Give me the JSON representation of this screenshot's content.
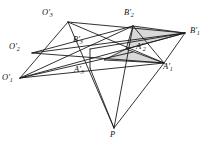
{
  "figure": {
    "name": "geometric-perspective-figure",
    "background_color": "#ffffff",
    "line_color": "#1b1b1b",
    "shade_color": "#c9c9c9",
    "width": 213,
    "height": 149
  },
  "vertices": [
    {
      "id": "O3",
      "base": "O",
      "prime": "′",
      "sub": "3",
      "label": "O′3",
      "x": 68,
      "y": 22,
      "label_x": 42,
      "label_y": 9
    },
    {
      "id": "B2",
      "base": "B",
      "prime": "′",
      "sub": "2",
      "label": "B′2",
      "x": 133,
      "y": 26,
      "label_x": 124,
      "label_y": 9
    },
    {
      "id": "B1",
      "base": "B",
      "prime": "′",
      "sub": "1",
      "label": "B′1",
      "x": 185,
      "y": 33,
      "label_x": 190,
      "label_y": 27
    },
    {
      "id": "B3",
      "base": "B",
      "prime": "′",
      "sub": "3",
      "label": "B′3",
      "x": 90,
      "y": 49,
      "label_x": 73,
      "label_y": 36
    },
    {
      "id": "A2",
      "base": "A",
      "prime": "′",
      "sub": "2",
      "label": "A′2",
      "x": 133,
      "y": 52,
      "label_x": 136,
      "label_y": 43
    },
    {
      "id": "O2",
      "base": "O",
      "prime": "′",
      "sub": "2",
      "label": "O′2",
      "x": 32,
      "y": 53,
      "label_x": 9,
      "label_y": 43
    },
    {
      "id": "A1",
      "base": "A",
      "prime": "′",
      "sub": "1",
      "label": "A′1",
      "x": 164,
      "y": 63,
      "label_x": 163,
      "label_y": 63
    },
    {
      "id": "A3",
      "base": "A",
      "prime": "′",
      "sub": "3",
      "label": "A′3",
      "x": 90,
      "y": 68,
      "label_x": 74,
      "label_y": 66
    },
    {
      "id": "O1",
      "base": "O",
      "prime": "′",
      "sub": "1",
      "label": "O′1",
      "x": 20,
      "y": 78,
      "label_x": 2,
      "label_y": 74
    },
    {
      "id": "P",
      "base": "P",
      "prime": "",
      "sub": "",
      "label": "P",
      "x": 114,
      "y": 128,
      "label_x": 110,
      "label_y": 131
    }
  ],
  "shaded_regions": [
    {
      "id": "upper-shaded-triangle",
      "points": "133,26 185,33 126,49"
    },
    {
      "id": "lower-shaded-triangle",
      "points": "126,49 164,63 104,60"
    }
  ],
  "edges": [
    {
      "id": "O3-B1",
      "from": "O3",
      "to": "B1"
    },
    {
      "id": "O3-A1",
      "from": "O3",
      "to": "A1"
    },
    {
      "id": "O3-O1",
      "from": "O3",
      "to": "O1"
    },
    {
      "id": "O1-B1",
      "from": "O1",
      "to": "B1"
    },
    {
      "id": "O1-B2",
      "from": "O1",
      "to": "B2"
    },
    {
      "id": "O1-A1",
      "from": "O1",
      "to": "A1"
    },
    {
      "id": "O1-A2",
      "from": "O1",
      "to": "A2"
    },
    {
      "id": "O2-B1",
      "from": "O2",
      "to": "B1"
    },
    {
      "id": "O2-A1",
      "from": "O2",
      "to": "A1"
    },
    {
      "id": "O2-B2",
      "from": "O2",
      "to": "B2"
    },
    {
      "id": "B2-A1",
      "from": "B2",
      "to": "A1"
    },
    {
      "id": "B1-A1",
      "from": "B1",
      "to": "A1"
    },
    {
      "id": "B3-A3",
      "from": "B3",
      "to": "A3"
    },
    {
      "id": "B3-B1",
      "from": "B3",
      "to": "B1"
    },
    {
      "id": "P-B2",
      "from": "P",
      "to": "B2"
    },
    {
      "id": "P-O3",
      "from": "P",
      "to": "O3"
    },
    {
      "id": "P-A3",
      "from": "P",
      "to": "A3"
    },
    {
      "id": "P-A1",
      "from": "P",
      "to": "A1"
    }
  ]
}
